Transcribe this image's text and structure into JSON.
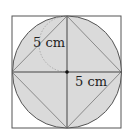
{
  "figure": {
    "labels": {
      "upper_left": "5 cm",
      "lower_right": "5 cm"
    },
    "colors": {
      "circle_fill": "#d9d9d9",
      "stroke": "#444444",
      "diamond_stroke": "#8a8a8a",
      "dotted_arc": "#8a8a8a"
    }
  }
}
